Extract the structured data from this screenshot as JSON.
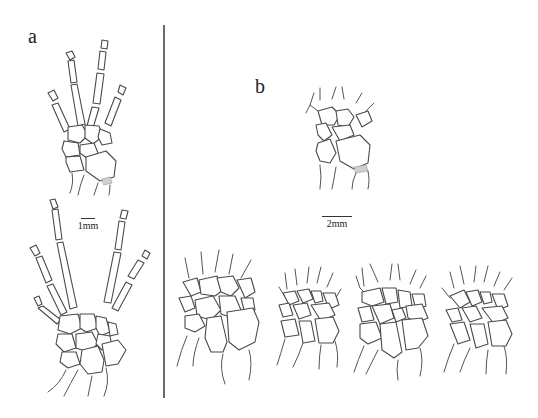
{
  "figure": {
    "panels": [
      {
        "label": "a",
        "scale_bar": "1mm",
        "drawings": [
          "forelimb-hand-skeleton-upper",
          "forelimb-hand-skeleton-lower"
        ]
      },
      {
        "label": "b",
        "scale_bar": "2mm",
        "drawings": [
          "carpal-top",
          "carpal-bottom-1",
          "carpal-bottom-2",
          "carpal-bottom-3",
          "carpal-bottom-4"
        ]
      }
    ]
  }
}
